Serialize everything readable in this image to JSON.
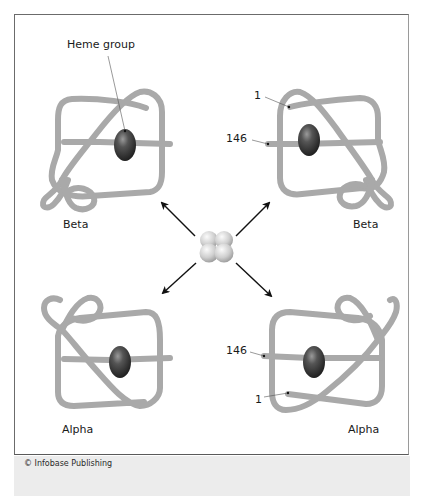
{
  "figure": {
    "labels": {
      "heme_group": "Heme group",
      "top_left_subunit": "Beta",
      "top_right_subunit": "Beta",
      "bottom_left_subunit": "Alpha",
      "bottom_right_subunit": "Alpha",
      "top_right_n_terminus": "1",
      "top_right_c_terminus": "146",
      "bottom_right_c_terminus": "146",
      "bottom_right_n_terminus": "1"
    },
    "copyright": "© Infobase Publishing",
    "colors": {
      "chain": "#a9a9a9",
      "heme": "#3d3d3d",
      "tetramer": "#d0d0d0",
      "arrow": "#111111",
      "border": "#6b6b6b",
      "footer_band": "#ececec"
    }
  }
}
